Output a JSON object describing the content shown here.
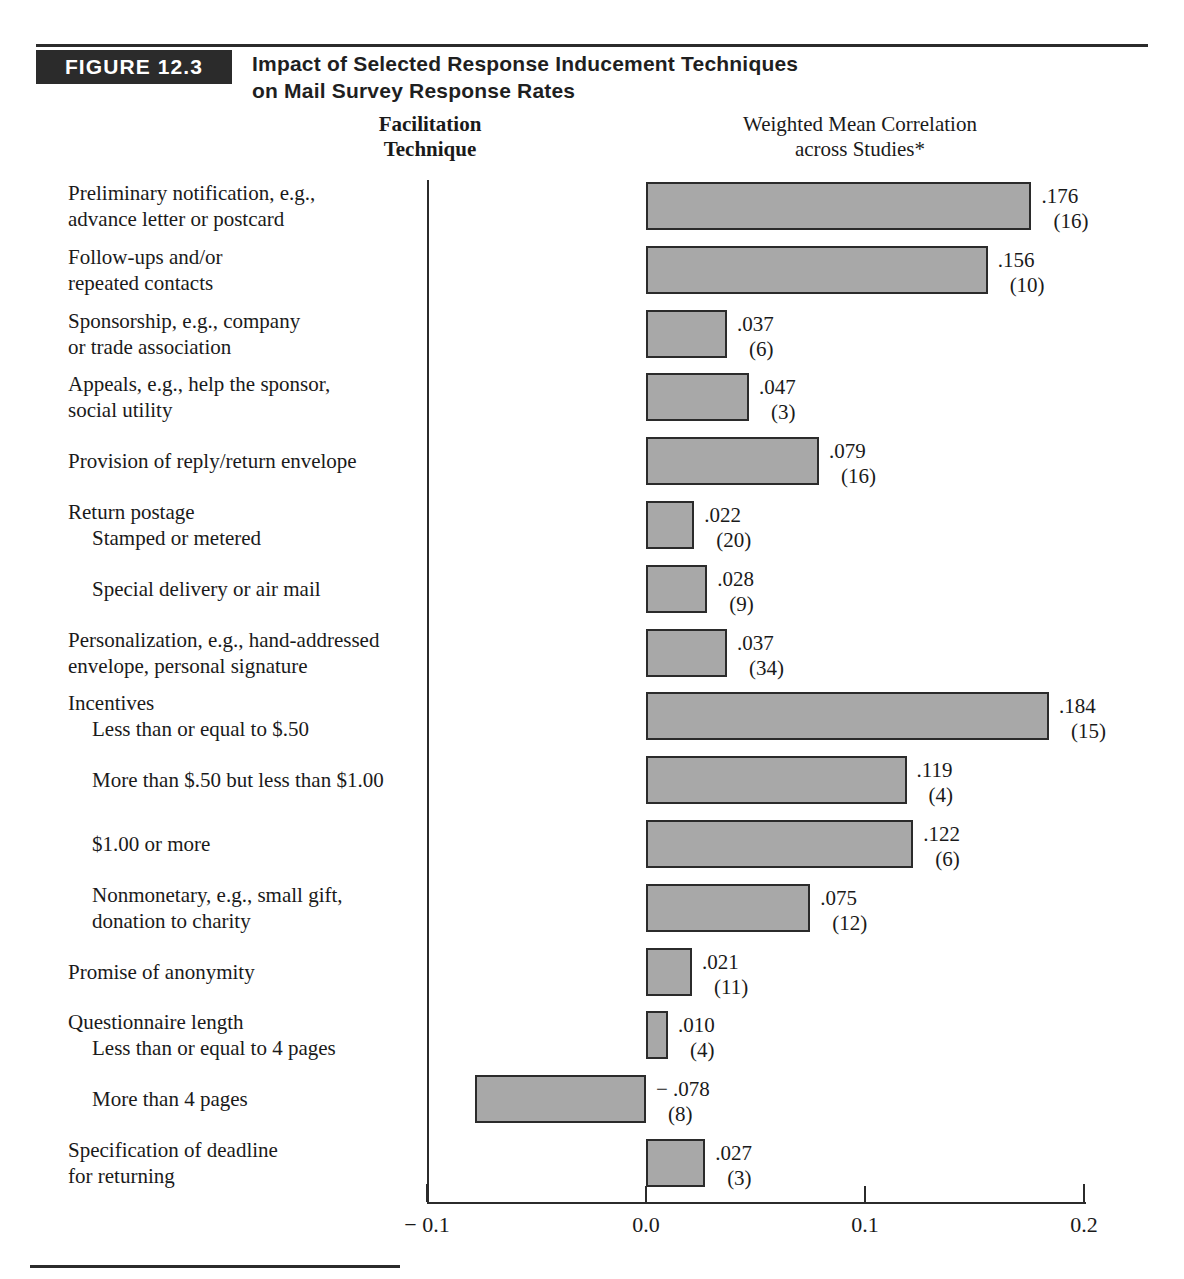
{
  "figure": {
    "badge": "FIGURE 12.3",
    "title_line1": "Impact of Selected Response Inducement Techniques",
    "title_line2": "on Mail Survey Response Rates"
  },
  "columns": {
    "left_line1": "Facilitation",
    "left_line2": "Technique",
    "right_line1": "Weighted Mean Correlation",
    "right_line2": "across Studies*"
  },
  "chart_data": {
    "type": "bar",
    "orientation": "horizontal",
    "title": "Impact of Selected Response Inducement Techniques on Mail Survey Response Rates",
    "xlabel": "Weighted Mean Correlation across Studies*",
    "ylabel": "Facilitation Technique",
    "xlim": [
      -0.1,
      0.2
    ],
    "xticks": [
      -0.1,
      0.0,
      0.1,
      0.2
    ],
    "xticklabels": [
      "− 0.1",
      "0.0",
      "0.1",
      "0.2"
    ],
    "grid": false,
    "legend": false,
    "bar_color": "#a8a8a8",
    "bar_edge_color": "#2b2b2b",
    "categories": [
      "Preliminary notification, e.g., advance letter or postcard",
      "Follow-ups and/or repeated contacts",
      "Sponsorship, e.g., company or trade association",
      "Appeals, e.g., help the sponsor, social utility",
      "Provision of reply/return envelope",
      "Return postage — Stamped or metered",
      "Return postage — Special delivery or air mail",
      "Personalization, e.g., hand-addressed envelope, personal signature",
      "Incentives — Less than or equal to $.50",
      "Incentives — More than $.50 but less than $1.00",
      "Incentives — $1.00 or more",
      "Incentives — Nonmonetary, e.g., small gift, donation to charity",
      "Promise of anonymity",
      "Questionnaire length — Less than or equal to 4 pages",
      "Questionnaire length — More than 4 pages",
      "Specification of deadline for returning"
    ],
    "values": [
      0.176,
      0.156,
      0.037,
      0.047,
      0.079,
      0.022,
      0.028,
      0.037,
      0.184,
      0.119,
      0.122,
      0.075,
      0.021,
      0.01,
      -0.078,
      0.027
    ],
    "study_counts": [
      16,
      10,
      6,
      3,
      16,
      20,
      9,
      34,
      15,
      4,
      6,
      12,
      11,
      4,
      8,
      3
    ]
  },
  "rows": [
    {
      "label_line1": "Preliminary notification, e.g.,",
      "label_line2": "advance letter or postcard",
      "indent": false,
      "value_text": ".176",
      "count_text": "(16)"
    },
    {
      "label_line1": "Follow-ups and/or",
      "label_line2": "repeated contacts",
      "indent": false,
      "value_text": ".156",
      "count_text": "(10)"
    },
    {
      "label_line1": "Sponsorship, e.g., company",
      "label_line2": "or trade association",
      "indent": false,
      "value_text": ".037",
      "count_text": "(6)"
    },
    {
      "label_line1": "Appeals, e.g., help the sponsor,",
      "label_line2": "social utility",
      "indent": false,
      "value_text": ".047",
      "count_text": "(3)"
    },
    {
      "label_line1": "Provision of reply/return envelope",
      "label_line2": "",
      "indent": false,
      "value_text": ".079",
      "count_text": "(16)"
    },
    {
      "label_line1": "Return postage",
      "label_line2": "Stamped or metered",
      "indent": false,
      "value_text": ".022",
      "count_text": "(20)"
    },
    {
      "label_line1": "Special delivery or air mail",
      "label_line2": "",
      "indent": true,
      "value_text": ".028",
      "count_text": "(9)"
    },
    {
      "label_line1": "Personalization, e.g., hand-addressed",
      "label_line2": "envelope, personal signature",
      "indent": false,
      "value_text": ".037",
      "count_text": "(34)"
    },
    {
      "label_line1": "Incentives",
      "label_line2": "Less than or equal to $.50",
      "indent": false,
      "value_text": ".184",
      "count_text": "(15)"
    },
    {
      "label_line1": "More than $.50 but less than $1.00",
      "label_line2": "",
      "indent": true,
      "value_text": ".119",
      "count_text": "(4)"
    },
    {
      "label_line1": "$1.00 or more",
      "label_line2": "",
      "indent": true,
      "value_text": ".122",
      "count_text": "(6)"
    },
    {
      "label_line1": "Nonmonetary, e.g., small gift,",
      "label_line2": "donation to charity",
      "indent": true,
      "value_text": ".075",
      "count_text": "(12)"
    },
    {
      "label_line1": "Promise of anonymity",
      "label_line2": "",
      "indent": false,
      "value_text": ".021",
      "count_text": "(11)"
    },
    {
      "label_line1": "Questionnaire length",
      "label_line2": "Less than or equal to 4 pages",
      "indent": false,
      "value_text": ".010",
      "count_text": "(4)"
    },
    {
      "label_line1": "More than 4 pages",
      "label_line2": "",
      "indent": true,
      "value_text": "− .078",
      "count_text": "(8)"
    },
    {
      "label_line1": "Specification of deadline",
      "label_line2": "for returning",
      "indent": false,
      "value_text": ".027",
      "count_text": "(3)"
    }
  ]
}
